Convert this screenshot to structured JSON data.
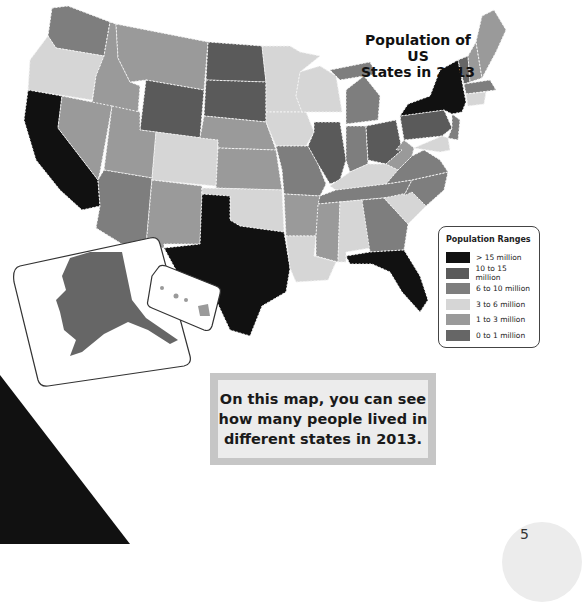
{
  "title": "Population of US States in 2013",
  "title_lines": [
    "Population of US",
    "States in 2013"
  ],
  "legend": {
    "title": "Population Ranges",
    "items": [
      {
        "label": "> 15 million",
        "color": "#111111"
      },
      {
        "label": "10 to 15 million",
        "color": "#5a5a5a"
      },
      {
        "label": "6 to 10 million",
        "color": "#7e7e7e"
      },
      {
        "label": "3 to 6 million",
        "color": "#d6d6d6"
      },
      {
        "label": "1 to 3 million",
        "color": "#9a9a9a"
      },
      {
        "label": "0 to 1 million",
        "color": "#666666"
      }
    ]
  },
  "caption": "On this map, you can see how many people lived in different states in 2013.",
  "page_number": "5",
  "colors": {
    "gt15": "#111111",
    "r10_15": "#5a5a5a",
    "r6_10": "#7e7e7e",
    "r3_6": "#d6d6d6",
    "r1_3": "#9a9a9a",
    "r0_1": "#666666",
    "border": "#f2f2f2",
    "triangle": "#111111"
  },
  "insets": [
    "Alaska",
    "Hawaii"
  ]
}
